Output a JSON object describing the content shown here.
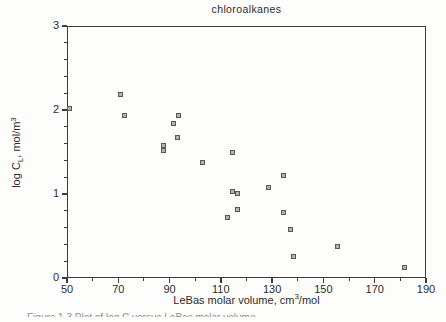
{
  "figure": {
    "title": "chloroalkanes",
    "caption_fragment": "Figure 1.3    Plot of log C versus LeBas molar volume"
  },
  "chart_data": {
    "type": "scatter",
    "title": "chloroalkanes",
    "xlabel": "LeBas molar volume, cm3/mol",
    "ylabel": "log CL, mol/m3",
    "xlim": [
      50,
      190
    ],
    "ylim": [
      0,
      3
    ],
    "x_major_ticks": [
      50,
      70,
      90,
      110,
      130,
      150,
      170,
      190
    ],
    "x_minor_ticks": [
      60,
      80,
      100,
      120,
      140,
      160,
      180
    ],
    "y_major_ticks": [
      0,
      1,
      2,
      3
    ],
    "y_minor_step": 0.2,
    "grid": false,
    "legend": null,
    "marker_shape": "square",
    "points": [
      [
        51,
        2.02
      ],
      [
        71,
        2.18
      ],
      [
        72.5,
        1.94
      ],
      [
        87.5,
        1.58
      ],
      [
        87.5,
        1.52
      ],
      [
        91.5,
        1.84
      ],
      [
        93.5,
        1.93
      ],
      [
        93,
        1.67
      ],
      [
        103,
        1.38
      ],
      [
        112.5,
        0.72
      ],
      [
        114.5,
        1.5
      ],
      [
        114.5,
        1.03
      ],
      [
        116.5,
        1.01
      ],
      [
        116.5,
        0.82
      ],
      [
        128.5,
        1.08
      ],
      [
        134.5,
        1.22
      ],
      [
        134.5,
        0.78
      ],
      [
        137,
        0.58
      ],
      [
        138.5,
        0.26
      ],
      [
        155.5,
        0.38
      ],
      [
        181.5,
        0.12
      ]
    ]
  },
  "ticks": {
    "x_labels": [
      "50",
      "70",
      "90",
      "110",
      "130",
      "150",
      "170",
      "190"
    ],
    "y_labels": [
      "0",
      "1",
      "2",
      "3"
    ]
  },
  "axis_labels": {
    "x": {
      "pre": "LeBas molar volume, cm",
      "sup": "3",
      "post": "/mol"
    },
    "y": {
      "pre": "log C",
      "sub": "L",
      "mid": ", mol/m",
      "sup": "3"
    }
  },
  "colors": {
    "background": "#fdfdfc",
    "axis": "#3d3d3d",
    "text": "#2b2b2b",
    "marker_fill": "#b2b2b2",
    "marker_border": "#585858"
  }
}
